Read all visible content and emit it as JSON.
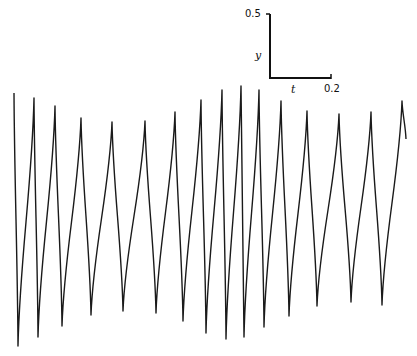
{
  "chart_data": {
    "type": "line",
    "title": "",
    "xlabel": "t",
    "ylabel": "y",
    "grid": false,
    "legend": null,
    "scale_bar": {
      "y_label": "y",
      "y_value": "0.5",
      "t_label": "t",
      "t_value": "0.2"
    },
    "extrema_px": [
      {
        "x": 14,
        "y": 93
      },
      {
        "x": 18,
        "y": 346
      },
      {
        "x": 34,
        "y": 98
      },
      {
        "x": 38,
        "y": 337
      },
      {
        "x": 55,
        "y": 106
      },
      {
        "x": 62,
        "y": 326
      },
      {
        "x": 81,
        "y": 118
      },
      {
        "x": 91,
        "y": 315
      },
      {
        "x": 112,
        "y": 122
      },
      {
        "x": 123,
        "y": 311
      },
      {
        "x": 145,
        "y": 121
      },
      {
        "x": 156,
        "y": 313
      },
      {
        "x": 175,
        "y": 112
      },
      {
        "x": 183,
        "y": 321
      },
      {
        "x": 201,
        "y": 100
      },
      {
        "x": 206,
        "y": 333
      },
      {
        "x": 222,
        "y": 90
      },
      {
        "x": 226,
        "y": 339
      },
      {
        "x": 241,
        "y": 86
      },
      {
        "x": 244,
        "y": 337
      },
      {
        "x": 259,
        "y": 90
      },
      {
        "x": 264,
        "y": 327
      },
      {
        "x": 281,
        "y": 101
      },
      {
        "x": 289,
        "y": 316
      },
      {
        "x": 307,
        "y": 111
      },
      {
        "x": 317,
        "y": 306
      },
      {
        "x": 339,
        "y": 114
      },
      {
        "x": 351,
        "y": 302
      },
      {
        "x": 371,
        "y": 112
      },
      {
        "x": 382,
        "y": 305
      },
      {
        "x": 402,
        "y": 101
      },
      {
        "x": 406,
        "y": 139
      }
    ]
  },
  "labels": {
    "scale_y_value": "0.5",
    "scale_y_name": "y",
    "scale_t_name": "t",
    "scale_t_value": "0.2"
  }
}
